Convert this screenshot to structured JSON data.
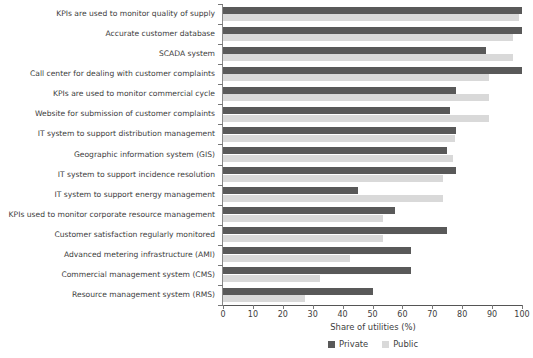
{
  "chart_data": {
    "type": "bar",
    "orientation": "horizontal",
    "title": "",
    "xlabel": "Share of utilities (%)",
    "ylabel": "",
    "xlim": [
      0,
      100
    ],
    "xticks": [
      0,
      10,
      20,
      30,
      40,
      50,
      60,
      70,
      80,
      90,
      100
    ],
    "grid": false,
    "legend_position": "bottom",
    "categories": [
      "KPIs are used to monitor quality of supply",
      "Accurate customer database",
      "SCADA system",
      "Call center for dealing with customer complaints",
      "KPIs are used to monitor commercial cycle",
      "Website for submission of customer complaints",
      "IT system to support distribution management",
      "Geographic information system (GIS)",
      "IT system to support incidence resolution",
      "IT system to support energy management",
      "KPIs used to monitor corporate resource management",
      "Customer satisfaction regularly monitored",
      "Advanced metering infrastructure (AMI)",
      "Commercial management system (CMS)",
      "Resource management system (RMS)"
    ],
    "series": [
      {
        "name": "Private",
        "color": "#595959",
        "values": [
          100,
          100,
          88,
          100,
          78,
          76,
          78,
          75,
          78,
          45,
          57.5,
          75,
          63,
          63,
          50
        ]
      },
      {
        "name": "Public",
        "color": "#d9d9d9",
        "values": [
          99,
          97,
          97,
          89,
          89,
          89,
          77.5,
          77,
          73.5,
          73.5,
          53.5,
          53.5,
          42.5,
          32.5,
          27.5
        ]
      }
    ]
  },
  "legend": {
    "entries": [
      {
        "label": "Private",
        "color": "#595959"
      },
      {
        "label": "Public",
        "color": "#d9d9d9"
      }
    ]
  },
  "axis": {
    "x_title": "Share of utilities (%)"
  }
}
